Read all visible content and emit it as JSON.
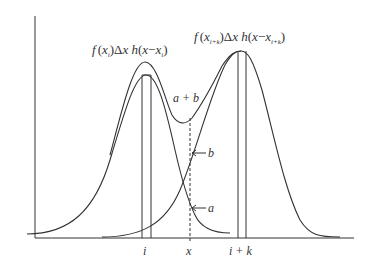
{
  "diagram": {
    "left_kernel_label": "f(x_i)Δx h(x−x_i)",
    "right_kernel_label": "f(x_{i+k})Δx h(x−x_{i+k})",
    "sum_label": "a + b",
    "point_b_label": "b",
    "point_a_label": "a",
    "x_ticks": [
      "i",
      "x",
      "i + k"
    ],
    "colors": {
      "line": "#333333",
      "background": "#ffffff"
    }
  },
  "labels": {
    "f_left": "f",
    "xi_open": "(x",
    "sub_i": "i",
    "close_delta": ")Δx ",
    "h": "h",
    "paren_x_minus": "(x − x",
    "close": ")",
    "sub_ik": "i+k",
    "a_plus_b": "a + b",
    "b": "b",
    "a": "a",
    "tick_i": "i",
    "tick_x": "x",
    "tick_ik": "i + k"
  }
}
